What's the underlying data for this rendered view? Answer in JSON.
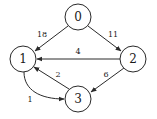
{
  "diagram": {
    "type": "directed-weighted-graph",
    "nodes": [
      {
        "id": "0",
        "label": "0",
        "cx": 78,
        "cy": 17
      },
      {
        "id": "1",
        "label": "1",
        "cx": 23,
        "cy": 59
      },
      {
        "id": "2",
        "label": "2",
        "cx": 133,
        "cy": 59
      },
      {
        "id": "3",
        "label": "3",
        "cx": 78,
        "cy": 99
      }
    ],
    "edges": [
      {
        "from": "0",
        "to": "1",
        "weight": "18"
      },
      {
        "from": "0",
        "to": "2",
        "weight": "11"
      },
      {
        "from": "2",
        "to": "1",
        "weight": "4"
      },
      {
        "from": "3",
        "to": "1",
        "weight": "2"
      },
      {
        "from": "2",
        "to": "3",
        "weight": "6"
      },
      {
        "from": "1",
        "to": "3",
        "weight": "1"
      }
    ],
    "colors": {
      "stroke": "#2a2a2a",
      "text": "#1a1a1a",
      "background": "#ffffff"
    }
  }
}
